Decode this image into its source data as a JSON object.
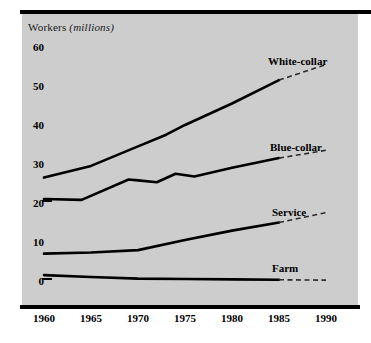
{
  "chart_data": {
    "type": "line",
    "title": "Workers (millions)",
    "title_plain": "Workers",
    "title_italic": "(millions)",
    "xlabel": "",
    "ylabel": "Workers (millions)",
    "x": [
      1960,
      1965,
      1970,
      1975,
      1980,
      1985,
      1990
    ],
    "xlim": [
      1960,
      1990
    ],
    "ylim": [
      0,
      60
    ],
    "yticks": [
      0,
      10,
      20,
      30,
      40,
      50,
      60
    ],
    "xticks": [
      1960,
      1965,
      1970,
      1975,
      1980,
      1985,
      1990
    ],
    "grid": false,
    "legend": "inline-labels-right",
    "projection_note": "dashed segments from 1985 to 1990 are projections",
    "series": [
      {
        "name": "White-collar",
        "label": "White-collar",
        "color": "#000000",
        "points": [
          {
            "x": 1960,
            "y": 26.0
          },
          {
            "x": 1965,
            "y": 29.0
          },
          {
            "x": 1970,
            "y": 34.0
          },
          {
            "x": 1973,
            "y": 37.0
          },
          {
            "x": 1975,
            "y": 39.5
          },
          {
            "x": 1980,
            "y": 45.0
          },
          {
            "x": 1985,
            "y": 51.0
          }
        ],
        "projected": [
          {
            "x": 1985,
            "y": 51.0
          },
          {
            "x": 1990,
            "y": 55.0
          }
        ]
      },
      {
        "name": "Blue-collar",
        "label": "Blue-collar",
        "color": "#000000",
        "points": [
          {
            "x": 1960,
            "y": 20.5
          },
          {
            "x": 1964,
            "y": 20.3
          },
          {
            "x": 1969,
            "y": 25.5
          },
          {
            "x": 1970,
            "y": 25.3
          },
          {
            "x": 1972,
            "y": 24.8
          },
          {
            "x": 1974,
            "y": 27.0
          },
          {
            "x": 1976,
            "y": 26.3
          },
          {
            "x": 1980,
            "y": 28.5
          },
          {
            "x": 1985,
            "y": 31.0
          }
        ],
        "projected": [
          {
            "x": 1985,
            "y": 31.0
          },
          {
            "x": 1990,
            "y": 33.0
          }
        ]
      },
      {
        "name": "Service",
        "label": "Service",
        "color": "#000000",
        "points": [
          {
            "x": 1960,
            "y": 6.5
          },
          {
            "x": 1965,
            "y": 6.8
          },
          {
            "x": 1970,
            "y": 7.4
          },
          {
            "x": 1975,
            "y": 10.0
          },
          {
            "x": 1980,
            "y": 12.4
          },
          {
            "x": 1985,
            "y": 14.5
          }
        ],
        "projected": [
          {
            "x": 1985,
            "y": 14.5
          },
          {
            "x": 1990,
            "y": 17.0
          }
        ]
      },
      {
        "name": "Farm",
        "label": "Farm",
        "color": "#000000",
        "points": [
          {
            "x": 1960,
            "y": 1.0
          },
          {
            "x": 1965,
            "y": 0.5
          },
          {
            "x": 1970,
            "y": 0.1
          },
          {
            "x": 1975,
            "y": 0.0
          },
          {
            "x": 1980,
            "y": -0.1
          },
          {
            "x": 1985,
            "y": -0.2
          }
        ],
        "projected": [
          {
            "x": 1985,
            "y": -0.2
          },
          {
            "x": 1990,
            "y": -0.3
          }
        ]
      }
    ]
  },
  "yticks": [
    {
      "label": "60"
    },
    {
      "label": "50"
    },
    {
      "label": "40"
    },
    {
      "label": "30"
    },
    {
      "label": "20"
    },
    {
      "label": "10"
    },
    {
      "label": "0"
    }
  ],
  "xticks": [
    {
      "label": "1960"
    },
    {
      "label": "1965"
    },
    {
      "label": "1970"
    },
    {
      "label": "1975"
    },
    {
      "label": "1980"
    },
    {
      "label": "1985"
    },
    {
      "label": "1990"
    }
  ],
  "series_labels": [
    {
      "label": "White-collar"
    },
    {
      "label": "Blue-collar"
    },
    {
      "label": "Service"
    },
    {
      "label": "Farm"
    }
  ]
}
